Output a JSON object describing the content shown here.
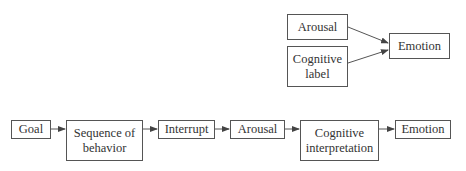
{
  "diagram": {
    "top_model": {
      "nodes": [
        {
          "id": "arousal",
          "label": "Arousal"
        },
        {
          "id": "cognitive-label",
          "label": "Cognitive label"
        },
        {
          "id": "emotion",
          "label": "Emotion"
        }
      ],
      "edges": [
        {
          "from": "arousal",
          "to": "emotion"
        },
        {
          "from": "cognitive-label",
          "to": "emotion"
        }
      ]
    },
    "bottom_model": {
      "nodes": [
        {
          "id": "goal",
          "label": "Goal"
        },
        {
          "id": "sequence-of-behavior",
          "label": "Sequence of behavior"
        },
        {
          "id": "interrupt",
          "label": "Interrupt"
        },
        {
          "id": "arousal",
          "label": "Arousal"
        },
        {
          "id": "cognitive-interpretation",
          "label": "Cognitive interpretation"
        },
        {
          "id": "emotion",
          "label": "Emotion"
        }
      ],
      "edges": [
        {
          "from": "goal",
          "to": "sequence-of-behavior"
        },
        {
          "from": "sequence-of-behavior",
          "to": "interrupt"
        },
        {
          "from": "interrupt",
          "to": "arousal"
        },
        {
          "from": "arousal",
          "to": "cognitive-interpretation"
        },
        {
          "from": "cognitive-interpretation",
          "to": "emotion"
        }
      ]
    },
    "colors": {
      "stroke": "#555555",
      "text": "#333333",
      "background": "#ffffff"
    }
  }
}
